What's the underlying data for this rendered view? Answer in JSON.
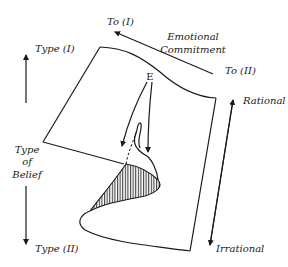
{
  "diagram": {
    "type": "cusp-catastrophe-surface",
    "labels": {
      "to_one": "To (I)",
      "to_two": "To (II)",
      "emotional_line1": "Emotional",
      "emotional_line2": "Commitment",
      "type_one": "Type (I)",
      "type_two": "Type (II)",
      "belief_line1": "Type",
      "belief_line2": "of",
      "belief_line3": "Belief",
      "rational": "Rational",
      "irrational": "Irrational",
      "equilibrium": "E"
    },
    "axes": [
      {
        "name": "emotional-commitment",
        "from": "To (II)",
        "to": "To (I)",
        "arrow": "single"
      },
      {
        "name": "type-of-belief",
        "from": "Type (I)",
        "to": "Type (II)",
        "arrow": "double"
      },
      {
        "name": "rationality",
        "from": "Rational",
        "to": "Irrational",
        "arrow": "double"
      }
    ],
    "colors": {
      "ink": "#1a1a1a",
      "background": "#ffffff"
    }
  }
}
